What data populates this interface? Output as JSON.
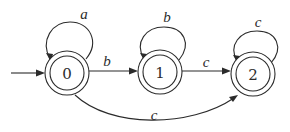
{
  "diagram": {
    "type": "finite-automaton",
    "colors": {
      "ink": "#2b2b2b",
      "background": "#ffffff"
    },
    "start_state": "0",
    "states": [
      {
        "id": "0",
        "label": "0",
        "accepting": true
      },
      {
        "id": "1",
        "label": "1",
        "accepting": true
      },
      {
        "id": "2",
        "label": "2",
        "accepting": true
      }
    ],
    "transitions": [
      {
        "from": "0",
        "to": "0",
        "label": "a"
      },
      {
        "from": "0",
        "to": "1",
        "label": "b"
      },
      {
        "from": "1",
        "to": "1",
        "label": "b"
      },
      {
        "from": "1",
        "to": "2",
        "label": "c"
      },
      {
        "from": "2",
        "to": "2",
        "label": "c"
      },
      {
        "from": "0",
        "to": "2",
        "label": "c"
      }
    ]
  }
}
